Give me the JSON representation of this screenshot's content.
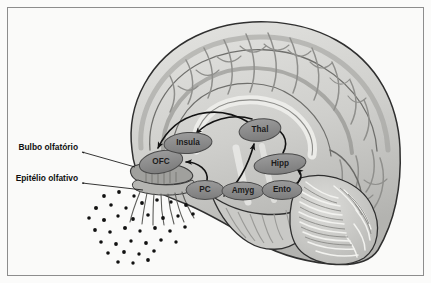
{
  "figure": {
    "background_color": "#fafaf9",
    "frame_color": "#8d8d8d"
  },
  "colors": {
    "cortex_fill": "#cfcfcc",
    "cortex_dark": "#a9a9a6",
    "cortex_light": "#e2e2df",
    "outline": "#3a3a3a",
    "node_fill": "#8c8c8c",
    "node_stroke": "#4a4a4a",
    "node_text": "#1c1c1c",
    "arrow": "#121212",
    "odor_dot": "#111111",
    "bulb_fill": "#9d9d9a"
  },
  "side_labels": [
    {
      "id": "bulbo",
      "text": "Bulbo olfatório",
      "x": 78,
      "y": 148
    },
    {
      "id": "epitelio",
      "text": "Epitélio olfativo",
      "x": 78,
      "y": 179
    }
  ],
  "leader_lines": [
    {
      "from_label": "bulbo",
      "x1": 82,
      "y1": 152,
      "x2": 135,
      "y2": 167
    },
    {
      "from_label": "epitelio",
      "x1": 82,
      "y1": 183,
      "x2": 143,
      "y2": 190
    }
  ],
  "nodes": [
    {
      "id": "ofc",
      "label": "OFC",
      "cx": 161,
      "cy": 162,
      "rx": 22,
      "ry": 11,
      "rot": -12
    },
    {
      "id": "insula",
      "label": "Insula",
      "cx": 188,
      "cy": 143,
      "rx": 24,
      "ry": 10.5,
      "rot": -4
    },
    {
      "id": "thal",
      "label": "Thal",
      "cx": 260,
      "cy": 130,
      "rx": 21,
      "ry": 11,
      "rot": -8
    },
    {
      "id": "hipp",
      "label": "Hipp",
      "cx": 280,
      "cy": 164,
      "rx": 26,
      "ry": 10,
      "rot": -6
    },
    {
      "id": "pc",
      "label": "PC",
      "cx": 205,
      "cy": 190,
      "rx": 19,
      "ry": 9.5,
      "rot": 0
    },
    {
      "id": "amyg",
      "label": "Amyg",
      "cx": 243,
      "cy": 191,
      "rx": 21,
      "ry": 9,
      "rot": 0
    },
    {
      "id": "ento",
      "label": "Ento",
      "cx": 282,
      "cy": 190,
      "rx": 20,
      "ry": 9.5,
      "rot": 0
    }
  ],
  "connections": [
    {
      "from": "thal",
      "to": "ofc",
      "style": "arc-left-long"
    },
    {
      "from": "thal",
      "to": "insula",
      "style": "arc-left-short"
    },
    {
      "from": "pc",
      "to": "ofc",
      "style": "arc-up-left"
    },
    {
      "from": "pc",
      "to": "thal",
      "style": "arc-up-right"
    },
    {
      "from": "hipp",
      "to": "thal",
      "style": "arc-up"
    },
    {
      "from": "ento",
      "to": "hipp",
      "style": "arc-up-short"
    }
  ],
  "odor_dots_count": 38
}
